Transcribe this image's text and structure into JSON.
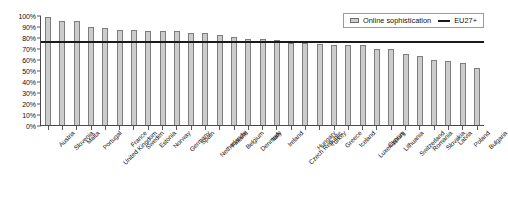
{
  "chart_data": {
    "type": "bar",
    "title": "",
    "xlabel": "",
    "ylabel": "",
    "ylim": [
      0,
      100
    ],
    "grid": false,
    "legend_position": "top-right",
    "y_ticks": [
      "0%",
      "10%",
      "20%",
      "30%",
      "40%",
      "50%",
      "60%",
      "70%",
      "80%",
      "90%",
      "100%"
    ],
    "y_tick_values": [
      0,
      10,
      20,
      30,
      40,
      50,
      60,
      70,
      80,
      90,
      100
    ],
    "categories": [
      "Austria",
      "Slovenia",
      "Malta",
      "Portugal",
      "United Kingdom",
      "France",
      "Sweden",
      "Estonia",
      "Norway",
      "Germany",
      "Spain",
      "Netherlands",
      "Finland",
      "Belgium",
      "Denmark",
      "Italy",
      "Ireland",
      "Czech Republic",
      "Hungary",
      "Turkey",
      "Greece",
      "Iceland",
      "Luxembourg",
      "Cyprus",
      "Lithuania",
      "Switzerland",
      "Romania",
      "Slovakia",
      "Latvia",
      "Poland",
      "Bulgaria"
    ],
    "series": [
      {
        "name": "Online sophistication",
        "type": "bar",
        "values": [
          99,
          95,
          95,
          90,
          89,
          87,
          87,
          86,
          86,
          86,
          84,
          84,
          83,
          81,
          79,
          79,
          78,
          75,
          75,
          74,
          73,
          73,
          73,
          70,
          70,
          65,
          63,
          60,
          59,
          57,
          52
        ]
      },
      {
        "name": "EU27+",
        "type": "reference-line",
        "value": 76
      }
    ],
    "legend": [
      {
        "label": "Online sophistication",
        "marker": "bar-swatch"
      },
      {
        "label": "EU27+",
        "marker": "line-swatch"
      }
    ],
    "colors": {
      "bar_fill": "#cccccc",
      "bar_border": "#7d7d7d",
      "reference_line": "#1a1a1a",
      "axis": "#4a4a4a",
      "text": "#111111",
      "background": "#ffffff"
    }
  }
}
